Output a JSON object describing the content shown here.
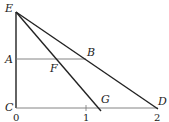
{
  "diagram": {
    "points": {
      "E": "E",
      "A": "A",
      "B": "B",
      "F": "F",
      "C": "C",
      "G": "G",
      "D": "D"
    },
    "axis_ticks": [
      "0",
      "1",
      "2"
    ],
    "colors": {
      "heavy": "#222222",
      "light": "#777777"
    }
  }
}
